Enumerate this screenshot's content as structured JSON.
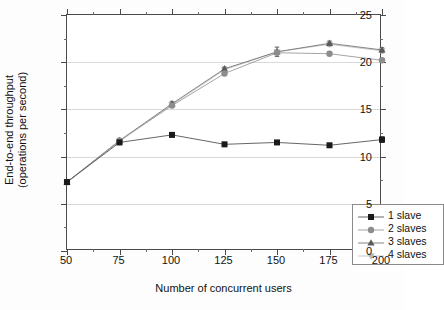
{
  "chart_data": {
    "type": "line",
    "title": "",
    "xlabel": "Number of concurrent users",
    "ylabel": "End-to-end throughput\n(operations per second)",
    "ylabel_line1": "End-to-end throughput",
    "ylabel_line2": "(operations per second)",
    "x": [
      50,
      75,
      100,
      125,
      150,
      175,
      200
    ],
    "xlim": [
      50,
      200
    ],
    "ylim": [
      0,
      25
    ],
    "xticks": [
      "50",
      "75",
      "100",
      "125",
      "150",
      "175",
      "200"
    ],
    "yticks": [
      "0",
      "5",
      "10",
      "15",
      "20",
      "25"
    ],
    "ytick_values": [
      0,
      5,
      10,
      15,
      20,
      25
    ],
    "grid": "horizontal-only",
    "legend_position": "lower-right",
    "series": [
      {
        "name": "1 slave",
        "marker": "square",
        "color": "#1a1a1a",
        "line_color": "#555555",
        "x": [
          50,
          75,
          100,
          125,
          150,
          175,
          200
        ],
        "values": [
          7.3,
          11.5,
          12.3,
          11.3,
          11.5,
          11.2,
          11.8
        ],
        "errors": [
          0,
          0.15,
          0.2,
          0.15,
          0.15,
          0.15,
          0.3
        ]
      },
      {
        "name": "2 slaves",
        "marker": "circle",
        "color": "#8c8c8c",
        "line_color": "#9a9a9a",
        "x": [
          50,
          75,
          100,
          125,
          150,
          175,
          200
        ],
        "values": [
          7.3,
          11.7,
          15.4,
          18.8,
          21.0,
          20.9,
          20.2
        ],
        "errors": [
          0,
          0.15,
          0.2,
          0.2,
          0.2,
          0.2,
          0.2
        ]
      },
      {
        "name": "3 slaves",
        "marker": "triangle-up",
        "color": "#5a5a5a",
        "line_color": "#777777",
        "x": [
          50,
          75,
          100,
          125,
          150,
          175,
          200
        ],
        "values": [
          7.3,
          11.7,
          15.6,
          19.3,
          21.1,
          22.0,
          21.3
        ],
        "errors": [
          0,
          0.15,
          0.25,
          0.2,
          0.5,
          0.25,
          0.25
        ]
      },
      {
        "name": "4 slaves",
        "marker": "triangle-down",
        "color": "#b8b8b8",
        "line_color": "#c2c2c2",
        "x": [
          50,
          75,
          100,
          125,
          150,
          175,
          200
        ],
        "values": [
          7.3,
          11.6,
          15.5,
          19.2,
          21.1,
          21.9,
          21.2
        ],
        "errors": [
          0,
          0.15,
          0.25,
          0.2,
          0.5,
          0.25,
          0.25
        ]
      }
    ]
  },
  "legend": {
    "items": [
      {
        "label": "1 slave",
        "marker": "square",
        "color": "#1a1a1a"
      },
      {
        "label": "2 slaves",
        "marker": "circle",
        "color": "#8c8c8c"
      },
      {
        "label": "3 slaves",
        "marker": "triangle-up",
        "color": "#5a5a5a"
      },
      {
        "label": "4 slaves",
        "marker": "triangle-down",
        "color": "#b8b8b8"
      }
    ]
  },
  "axes": {
    "x_title": "Number of concurrent users",
    "y_title_line1": "End-to-end throughput",
    "y_title_line2": "(operations per second)"
  }
}
